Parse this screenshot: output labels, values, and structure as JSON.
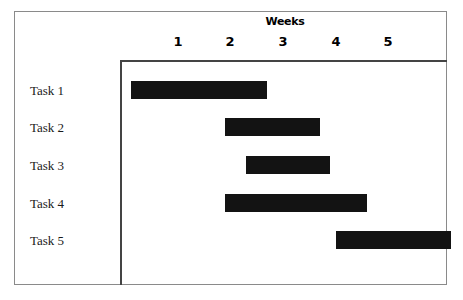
{
  "chart_data": {
    "type": "bar",
    "subtype": "gantt",
    "title": "Weeks",
    "xlabel": "Weeks",
    "ylabel": "",
    "orientation": "horizontal",
    "grid": false,
    "legend": null,
    "xlim": [
      0,
      6.2
    ],
    "xticks": [
      1,
      2,
      3,
      4,
      5
    ],
    "xtick_labels": [
      "1",
      "2",
      "3",
      "4",
      "5"
    ],
    "categories": [
      "Task 1",
      "Task 2",
      "Task 3",
      "Task 4",
      "Task 5"
    ],
    "bar_color": "#131313",
    "tasks": [
      {
        "label": "Task 1",
        "start": 0.1,
        "end": 2.7,
        "duration": 2.6
      },
      {
        "label": "Task 2",
        "start": 1.9,
        "end": 3.7,
        "duration": 1.8
      },
      {
        "label": "Task 3",
        "start": 2.3,
        "end": 3.9,
        "duration": 1.6
      },
      {
        "label": "Task 4",
        "start": 1.9,
        "end": 4.6,
        "duration": 2.7
      },
      {
        "label": "Task 5",
        "start": 4.0,
        "end": 6.2,
        "duration": 2.2
      }
    ]
  },
  "frame": {
    "border_color": "#8a8a8a",
    "axis_color": "#444444",
    "background": "#ffffff"
  }
}
